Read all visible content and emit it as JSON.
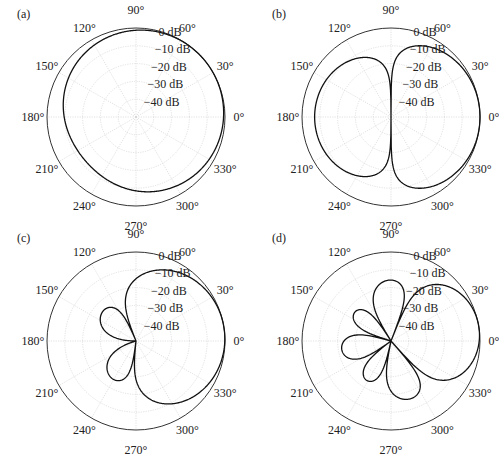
{
  "chart_data": [
    {
      "type": "polar",
      "panel_label": "(a)",
      "center": [
        136,
        117
      ],
      "radius": 89,
      "r_ticks": [
        "0 dB",
        "−10 dB",
        "−20 dB",
        "−30 dB",
        "−40 dB"
      ],
      "r_range_db": [
        -50,
        0
      ],
      "angle_ticks": [
        "0°",
        "30°",
        "60°",
        "90°",
        "120°",
        "150°",
        "180°",
        "210°",
        "240°",
        "270°",
        "300°",
        "330°"
      ],
      "pattern": {
        "form": "first-order",
        "a": 0.62,
        "steer_deg": 30,
        "order": 1
      },
      "description": "Broad cardioid-like pattern, max near 45°, shallow dip toward 180° (~-10 dB)"
    },
    {
      "type": "polar",
      "panel_label": "(b)",
      "center": [
        391,
        117
      ],
      "radius": 89,
      "r_ticks": [
        "0 dB",
        "−10 dB",
        "−20 dB",
        "−30 dB",
        "−40 dB"
      ],
      "r_range_db": [
        -50,
        0
      ],
      "angle_ticks": [
        "0°",
        "30°",
        "60°",
        "90°",
        "120°",
        "150°",
        "180°",
        "210°",
        "240°",
        "270°",
        "300°",
        "330°"
      ],
      "pattern": {
        "form": "dipole-mix",
        "a": 0.25,
        "order": 1
      },
      "description": "Front lobe toward 0°, rear lobe toward 180° (~-9 dB), nulls at 90° and 270°"
    },
    {
      "type": "polar",
      "panel_label": "(c)",
      "center": [
        136,
        341
      ],
      "radius": 89,
      "r_ticks": [
        "0 dB",
        "−10 dB",
        "−20 dB",
        "−30 dB",
        "−40 dB"
      ],
      "r_range_db": [
        -50,
        0
      ],
      "angle_ticks": [
        "0°",
        "30°",
        "60°",
        "90°",
        "120°",
        "150°",
        "180°",
        "210°",
        "240°",
        "270°",
        "300°",
        "330°"
      ],
      "pattern": {
        "form": "second-order",
        "order": 2
      },
      "description": "Main lobe toward ~0°, side lobes near 95°, 265° and 180° (~-10 dB)"
    },
    {
      "type": "polar",
      "panel_label": "(d)",
      "center": [
        391,
        341
      ],
      "radius": 89,
      "r_ticks": [
        "0 dB",
        "−10 dB",
        "−20 dB",
        "−30 dB",
        "−40 dB"
      ],
      "r_range_db": [
        -50,
        0
      ],
      "angle_ticks": [
        "0°",
        "30°",
        "60°",
        "90°",
        "120°",
        "150°",
        "180°",
        "210°",
        "240°",
        "270°",
        "300°",
        "330°"
      ],
      "pattern": {
        "form": "third-order",
        "order": 3
      },
      "description": "Main lobe toward ~0°, four smaller lobes near 80°, 115°, 180°, 245°, 280°"
    }
  ],
  "labels": {
    "a": "(a)",
    "b": "(b)",
    "c": "(c)",
    "d": "(d)"
  }
}
